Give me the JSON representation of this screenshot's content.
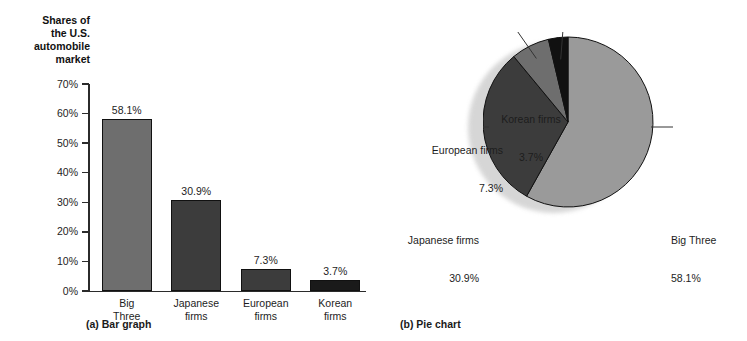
{
  "chart_data": [
    {
      "type": "bar",
      "panel_label": "(a) Bar graph",
      "title": "",
      "ylabel": "Shares of\nthe U.S.\nautomobile\nmarket",
      "xlabel": "",
      "ylim": [
        0,
        70
      ],
      "ytick_labels": [
        "70%",
        "60%",
        "50%",
        "40%",
        "30%",
        "20%",
        "10%",
        "0%"
      ],
      "ytick_values": [
        70,
        60,
        50,
        40,
        30,
        20,
        10,
        0
      ],
      "grid": false,
      "categories": [
        "Big\nThree",
        "Japanese\nfirms",
        "European\nfirms",
        "Korean\nfirms"
      ],
      "values": [
        58.1,
        30.9,
        7.3,
        3.7
      ],
      "value_labels": [
        "58.1%",
        "30.9%",
        "7.3%",
        "3.7%"
      ],
      "bar_colors": [
        "#6e6e6e",
        "#3c3c3c",
        "#3c3c3c",
        "#1a1a1a"
      ]
    },
    {
      "type": "pie",
      "panel_label": "(b) Pie chart",
      "title": "",
      "legend_position": "callout-labels",
      "labels": [
        "Big Three",
        "Japanese firms",
        "European firms",
        "Korean firms"
      ],
      "values": [
        58.1,
        30.9,
        7.3,
        3.7
      ],
      "value_labels": [
        "58.1%",
        "30.9%",
        "7.3%",
        "3.7%"
      ],
      "slice_colors": [
        "#9a9a9a",
        "#3c3c3c",
        "#6e6e6e",
        "#111111"
      ]
    }
  ],
  "bar": {
    "y_axis_title": "Shares of\nthe U.S.\nautomobile\nmarket",
    "caption": "(a) Bar graph",
    "ticks": [
      {
        "label": "70%"
      },
      {
        "label": "60%"
      },
      {
        "label": "50%"
      },
      {
        "label": "40%"
      },
      {
        "label": "30%"
      },
      {
        "label": "20%"
      },
      {
        "label": "10%"
      },
      {
        "label": "0%"
      }
    ],
    "bars": [
      {
        "category": "Big\nThree",
        "value_label": "58.1%"
      },
      {
        "category": "Japanese\nfirms",
        "value_label": "30.9%"
      },
      {
        "category": "European\nfirms",
        "value_label": "7.3%"
      },
      {
        "category": "Korean\nfirms",
        "value_label": "3.7%"
      }
    ]
  },
  "pie": {
    "caption": "(b) Pie chart",
    "callouts": [
      {
        "name": "Big Three",
        "value_label": "58.1%"
      },
      {
        "name": "Japanese firms",
        "value_label": "30.9%"
      },
      {
        "name": "European firms",
        "value_label": "7.3%"
      },
      {
        "name": "Korean firms",
        "value_label": "3.7%"
      }
    ]
  }
}
